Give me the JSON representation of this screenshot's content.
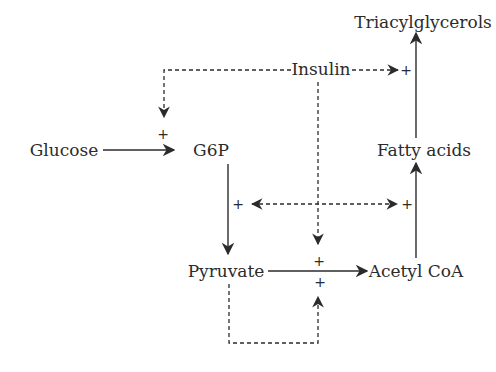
{
  "diagram": {
    "nodes": {
      "triacylglycerols": "Triacylglycerols",
      "insulin": "Insulin",
      "glucose": "Glucose",
      "g6p": "G6P",
      "fatty_acids": "Fatty acids",
      "pyruvate": "Pyruvate",
      "acetyl_coa": "Acetyl CoA"
    },
    "signs": {
      "glucose_to_g6p": "+",
      "insulin_to_tag": "+",
      "g6p_to_pyruvate": "+",
      "acetylcoa_to_fatty_acids": "+",
      "pyruvate_to_acetylcoa_top": "+",
      "pyruvate_to_acetylcoa_bottom": "+"
    },
    "edges": [
      {
        "from": "Glucose",
        "to": "G6P",
        "style": "solid",
        "sign": "+"
      },
      {
        "from": "G6P",
        "to": "Pyruvate",
        "style": "solid",
        "sign": "+"
      },
      {
        "from": "Pyruvate",
        "to": "Acetyl CoA",
        "style": "solid",
        "sign": "+"
      },
      {
        "from": "Acetyl CoA",
        "to": "Fatty acids",
        "style": "solid",
        "sign": "+"
      },
      {
        "from": "Fatty acids",
        "to": "Triacylglycerols",
        "style": "solid",
        "sign": "+"
      },
      {
        "from": "Insulin",
        "to": "Glucose→G6P",
        "style": "dashed"
      },
      {
        "from": "Insulin",
        "to": "Fatty acids→Triacylglycerols",
        "style": "dashed"
      },
      {
        "from": "Insulin",
        "to": "Pyruvate→Acetyl CoA",
        "style": "dashed"
      },
      {
        "from": "Insulin",
        "to": "G6P→Pyruvate",
        "style": "dashed"
      },
      {
        "from": "Insulin",
        "to": "Acetyl CoA→Fatty acids",
        "style": "dashed"
      },
      {
        "from": "Pyruvate",
        "to": "Pyruvate→Acetyl CoA",
        "style": "dashed"
      }
    ],
    "colors": {
      "ink": "#2b2b2b",
      "background": "#ffffff"
    }
  }
}
